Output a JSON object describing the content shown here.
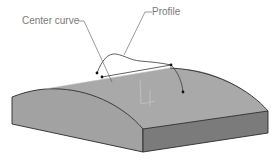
{
  "figure": {
    "labels": {
      "center_curve": "Center curve",
      "profile": "Profile"
    },
    "colors": {
      "top_surface": "#a9a9a9",
      "left_face": "#a2a2a2",
      "right_face": "#7b7b7b",
      "edge": "#2a2a2a",
      "leader": "#555555",
      "label_text": "#7a7a7a"
    }
  }
}
